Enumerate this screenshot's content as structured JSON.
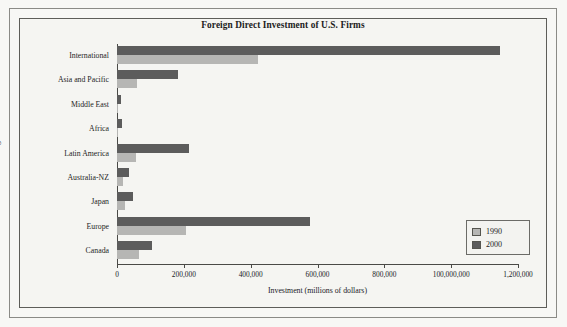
{
  "chart_data": {
    "type": "bar",
    "orientation": "horizontal",
    "title": "Foreign Direct Investment of U.S. Firms",
    "xlabel": "Investment (millions of dollars)",
    "ylabel": "Region",
    "categories": [
      "International",
      "Asia and Pacific",
      "Middle East",
      "Africa",
      "Latin America",
      "Australia-NZ",
      "Japan",
      "Europe",
      "Canada"
    ],
    "series": [
      {
        "name": "1990",
        "color": "#b6b6b4",
        "values": [
          422000,
          60000,
          4000,
          4000,
          57000,
          17000,
          23000,
          207000,
          66000
        ]
      },
      {
        "name": "2000",
        "color": "#5c5c5c",
        "values": [
          1146000,
          183000,
          11000,
          15000,
          215000,
          37000,
          48000,
          578000,
          105000
        ]
      }
    ],
    "xlim": [
      0,
      1200000
    ],
    "xticks": [
      0,
      200000,
      400000,
      600000,
      800000,
      1000000,
      1200000
    ],
    "xtick_labels": [
      "0",
      "200,000",
      "400,000",
      "600,000",
      "800,000",
      "100,000,000",
      "1,200,000"
    ],
    "grid": false,
    "legend_position": "lower right",
    "legend_entries": [
      "1990",
      "2000"
    ]
  },
  "legend": {
    "entries": [
      {
        "label": "1990",
        "color": "#b6b6b4"
      },
      {
        "label": "2000",
        "color": "#5c5c5c"
      }
    ]
  }
}
